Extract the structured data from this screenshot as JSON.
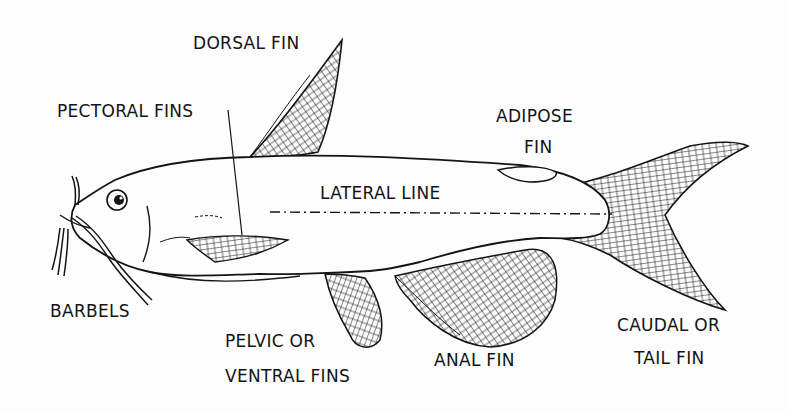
{
  "diagram": {
    "ink_color": "#141414",
    "background_color": "#fdfdfd",
    "labels": {
      "dorsal_fin": "DORSAL FIN",
      "pectoral_fins": "PECTORAL FINS",
      "adipose_fin_line1": "ADIPOSE",
      "adipose_fin_line2": "FIN",
      "lateral_line": "LATERAL LINE",
      "barbels": "BARBELS",
      "pelvic_fins_line1": "PELVIC OR",
      "pelvic_fins_line2": "VENTRAL FINS",
      "anal_fin": "ANAL FIN",
      "caudal_fin_line1": "CAUDAL OR",
      "caudal_fin_line2": "TAIL FIN"
    }
  }
}
